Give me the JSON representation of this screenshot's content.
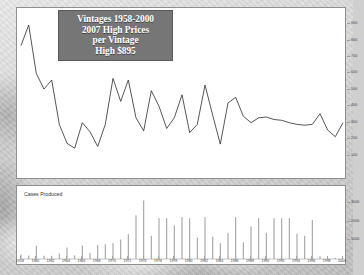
{
  "title": {
    "line1": "Vintages 1958-2000",
    "line2": "2007 High Prices",
    "line3": "per Vintage",
    "line4": "High $895",
    "box_color": "#767676",
    "text_color": "#ffffff"
  },
  "lower_panel": {
    "label": "Cases Produced"
  },
  "colors": {
    "line": "#2b2b2b",
    "bar": "#9a9a9a",
    "panel_bg": "#ffffff",
    "panel_border": "#8f8f8f",
    "background": "#cfcfcf"
  },
  "chart_data": [
    {
      "type": "line",
      "title": "Vintages 1958-2000 2007 High Prices per Vintage",
      "xlabel": "",
      "ylabel": "",
      "ylim": [
        0,
        950
      ],
      "yticks": [
        900,
        800,
        700,
        600,
        500,
        400,
        300,
        200,
        100
      ],
      "ytick_labels": [
        "900",
        "800",
        "700",
        "600",
        "500",
        "400",
        "300",
        "200",
        "100"
      ],
      "grid": false,
      "legend": "none",
      "annotation": "High $895",
      "x": [
        1958,
        1959,
        1960,
        1961,
        1962,
        1963,
        1964,
        1965,
        1966,
        1967,
        1968,
        1969,
        1970,
        1971,
        1972,
        1973,
        1974,
        1975,
        1976,
        1977,
        1978,
        1979,
        1980,
        1981,
        1982,
        1983,
        1984,
        1985,
        1986,
        1987,
        1988,
        1989,
        1990,
        1991,
        1992,
        1993,
        1994,
        1995,
        1996,
        1997,
        1998,
        1999,
        2000
      ],
      "values": [
        770,
        895,
        600,
        505,
        560,
        290,
        175,
        145,
        300,
        245,
        155,
        290,
        570,
        430,
        560,
        330,
        250,
        495,
        400,
        265,
        330,
        470,
        240,
        290,
        530,
        345,
        170,
        420,
        455,
        340,
        300,
        330,
        335,
        320,
        315,
        300,
        290,
        285,
        290,
        355,
        255,
        215,
        300
      ]
    },
    {
      "type": "bar",
      "title": "Cases Produced",
      "xlabel": "",
      "ylabel": "",
      "ylim": [
        0,
        3600
      ],
      "yticks": [
        3000,
        2000,
        1000
      ],
      "ytick_labels": [
        "3000",
        "2000",
        "1000"
      ],
      "grid": false,
      "legend": "none",
      "categories": [
        1958,
        1959,
        1960,
        1961,
        1962,
        1963,
        1964,
        1965,
        1966,
        1967,
        1968,
        1969,
        1970,
        1971,
        1972,
        1973,
        1974,
        1975,
        1976,
        1977,
        1978,
        1979,
        1980,
        1981,
        1982,
        1983,
        1984,
        1985,
        1986,
        1987,
        1988,
        1989,
        1990,
        1991,
        1992,
        1993,
        1994,
        1995,
        1996,
        1997,
        1998,
        1999,
        2000
      ],
      "values": [
        240,
        190,
        700,
        180,
        170,
        300,
        610,
        200,
        720,
        330,
        760,
        790,
        850,
        1050,
        1330,
        2350,
        3150,
        1250,
        2200,
        2200,
        1800,
        2250,
        2200,
        1150,
        2250,
        1200,
        850,
        1400,
        2250,
        900,
        1750,
        2200,
        1400,
        2200,
        2200,
        2200,
        1350,
        1250,
        2100,
        150,
        60,
        50,
        40
      ]
    }
  ],
  "xaxis": {
    "tick_years": [
      "1958",
      "1960",
      "1962",
      "1964",
      "1966",
      "1968",
      "1970",
      "1972",
      "1974",
      "1976",
      "1978",
      "1980",
      "1982",
      "1984",
      "1986",
      "1988",
      "1990",
      "1992",
      "1994",
      "1996",
      "1998",
      "2000"
    ]
  }
}
